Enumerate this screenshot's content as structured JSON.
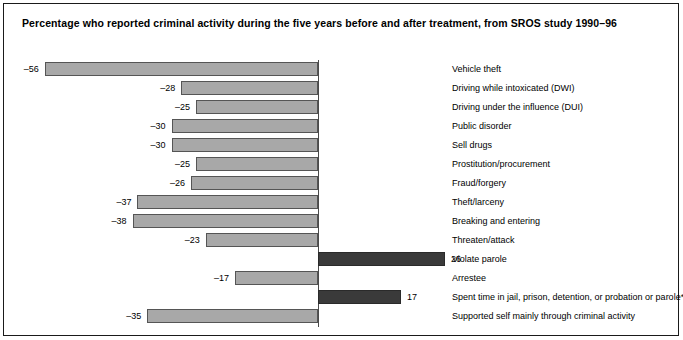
{
  "chart_data": {
    "type": "bar",
    "orientation": "horizontal",
    "title": "Percentage who reported criminal activity during the five years before and after treatment, from SROS study 1990–96",
    "xlabel": "",
    "ylabel": "",
    "grid": false,
    "legend": "none",
    "xlim": [
      -56,
      26
    ],
    "zero_line": true,
    "categories": [
      "Vehicle theft",
      "Driving while intoxicated (DWI)",
      "Driving under the influence (DUI)",
      "Public disorder",
      "Sell drugs",
      "Prostitution/procurement",
      "Fraud/forgery",
      "Theft/larceny",
      "Breaking and entering",
      "Threaten/attack",
      "Violate parole",
      "Arrestee",
      "Spent time in jail, prison, detention, or probation or parole*",
      "Supported self mainly through criminal activity"
    ],
    "values": [
      -56,
      -28,
      -25,
      -30,
      -30,
      -25,
      -26,
      -37,
      -38,
      -23,
      26,
      -17,
      17,
      -35
    ],
    "value_labels": [
      "–56",
      "–28",
      "–25",
      "–30",
      "–30",
      "–25",
      "–26",
      "–37",
      "–38",
      "–23",
      "26",
      "–17",
      "17",
      "–35"
    ],
    "colors": {
      "negative_bar": "#a8a8a8",
      "negative_bar_border": "#555555",
      "positive_bar": "#3a3a3a",
      "positive_bar_border": "#2a2a2a",
      "axis": "#4a4a4a",
      "frame": "#1a1a1a",
      "text": "#000000",
      "background": "#ffffff"
    }
  }
}
